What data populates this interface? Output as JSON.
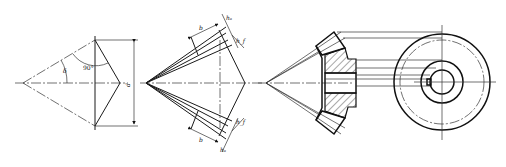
{
  "figure": {
    "views": [
      {
        "id": "pitch-cone",
        "labels": {
          "cone_angle": "δ",
          "right_angle": "90°",
          "diameter": "d"
        }
      },
      {
        "id": "tooth-proportions",
        "labels": {
          "face_width_top": "b",
          "addendum_top": "hₐ",
          "dedendum_top": "h_f",
          "face_width_bottom": "b",
          "addendum_bottom": "hₐ",
          "dedendum_bottom": "h_f"
        }
      },
      {
        "id": "sectional-view",
        "labels": {}
      },
      {
        "id": "end-view",
        "labels": {}
      }
    ],
    "colors": {
      "line": "#1a1a1a",
      "background": "#ffffff",
      "hatch": "#222222"
    }
  }
}
